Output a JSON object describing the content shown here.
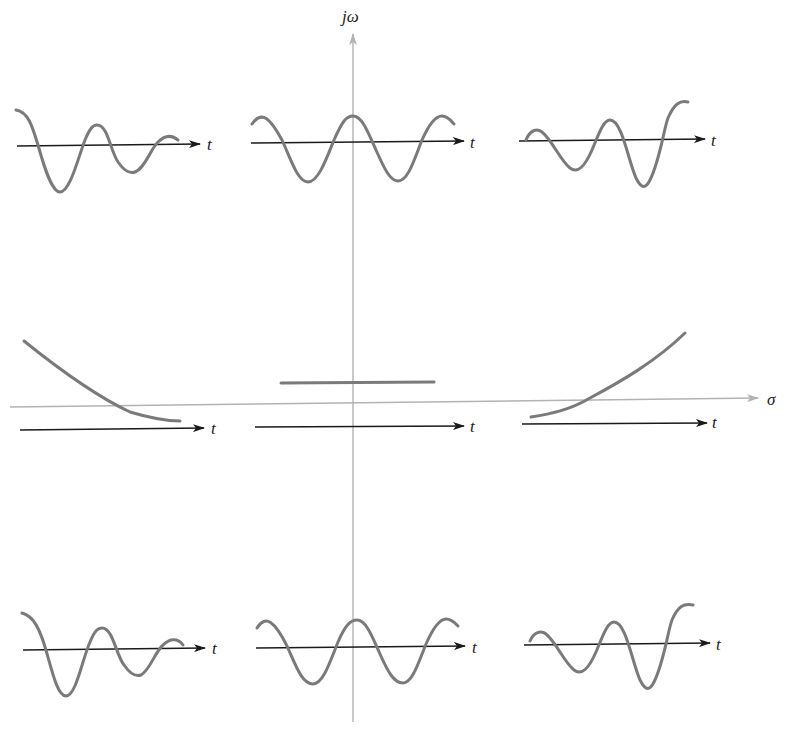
{
  "axes": {
    "vertical_label": "jω",
    "horizontal_label": "σ",
    "color": "#b3b3b3"
  },
  "time_axis_label": "t",
  "colors": {
    "waveform": "#7a7a7a",
    "time_axis": "#1a1a1a",
    "background": "#ffffff"
  },
  "panels": [
    {
      "id": "top-left",
      "description": "decaying oscillation (LHP complex pole, upper)"
    },
    {
      "id": "top-center",
      "description": "sustained oscillation (jω-axis pole, upper)"
    },
    {
      "id": "top-right",
      "description": "growing oscillation (RHP complex pole, upper)"
    },
    {
      "id": "middle-left",
      "description": "decaying exponential (negative real pole)"
    },
    {
      "id": "middle-center",
      "description": "constant (pole at origin)"
    },
    {
      "id": "middle-right",
      "description": "growing exponential (positive real pole)"
    },
    {
      "id": "bottom-left",
      "description": "decaying oscillation (LHP complex pole, lower)"
    },
    {
      "id": "bottom-center",
      "description": "sustained oscillation (jω-axis pole, lower)"
    },
    {
      "id": "bottom-right",
      "description": "growing oscillation (RHP complex pole, lower)"
    }
  ]
}
